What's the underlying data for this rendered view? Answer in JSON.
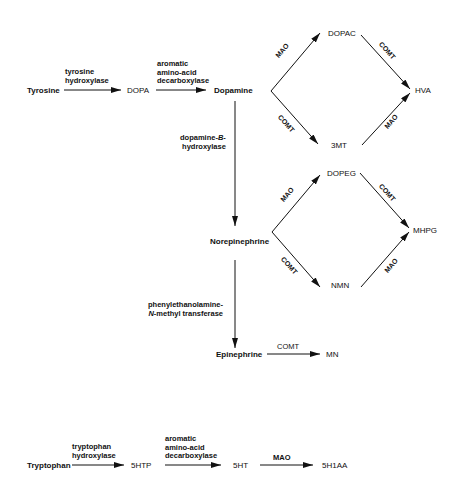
{
  "diagram": {
    "catecholamine_pathway": {
      "nodes": {
        "tyrosine": "Tyrosine",
        "dopa": "DOPA",
        "dopamine": "Dopamine",
        "dopac": "DOPAC",
        "hva": "HVA",
        "three_mt": "3MT",
        "norepinephrine": "Norepinephrine",
        "dopeg": "DOPEG",
        "mhpg": "MHPG",
        "nmn": "NMN",
        "epinephrine": "Epinephrine",
        "mn": "MN"
      },
      "enzymes": {
        "tyrosine_hydroxylase": [
          "tyrosine",
          "hydroxylase"
        ],
        "aadc": [
          "aromatic",
          "amino-acid",
          "decarboxylase"
        ],
        "dbh": [
          "dopamine-",
          "B",
          "-",
          "hydroxylase"
        ],
        "pnmt": [
          "phenylethanolamine-",
          "N",
          "-methyl transferase"
        ],
        "mao": "MAO",
        "comt": "COMT"
      }
    },
    "serotonin_pathway": {
      "nodes": {
        "tryptophan": "Tryptophan",
        "five_htp": "5HTP",
        "five_ht": "5HT",
        "five_hiaa": "5H1AA"
      },
      "enzymes": {
        "tryptophan_hydroxylase": [
          "tryptophan",
          "hydroxylase"
        ],
        "aadc": [
          "aromatic",
          "amino-acid",
          "decarboxylase"
        ],
        "mao": "MAO"
      }
    },
    "edges": [
      {
        "from": "Tyrosine",
        "to": "DOPA",
        "enzyme": "tyrosine hydroxylase"
      },
      {
        "from": "DOPA",
        "to": "Dopamine",
        "enzyme": "aromatic amino-acid decarboxylase"
      },
      {
        "from": "Dopamine",
        "to": "DOPAC",
        "enzyme": "MAO"
      },
      {
        "from": "DOPAC",
        "to": "HVA",
        "enzyme": "COMT"
      },
      {
        "from": "Dopamine",
        "to": "3MT",
        "enzyme": "COMT"
      },
      {
        "from": "3MT",
        "to": "HVA",
        "enzyme": "MAO"
      },
      {
        "from": "Dopamine",
        "to": "Norepinephrine",
        "enzyme": "dopamine-B-hydroxylase"
      },
      {
        "from": "Norepinephrine",
        "to": "DOPEG",
        "enzyme": "MAO"
      },
      {
        "from": "DOPEG",
        "to": "MHPG",
        "enzyme": "COMT"
      },
      {
        "from": "Norepinephrine",
        "to": "NMN",
        "enzyme": "COMT"
      },
      {
        "from": "NMN",
        "to": "MHPG",
        "enzyme": "MAO"
      },
      {
        "from": "Norepinephrine",
        "to": "Epinephrine",
        "enzyme": "phenylethanolamine-N-methyl transferase"
      },
      {
        "from": "Epinephrine",
        "to": "MN",
        "enzyme": "COMT"
      },
      {
        "from": "Tryptophan",
        "to": "5HTP",
        "enzyme": "tryptophan hydroxylase"
      },
      {
        "from": "5HTP",
        "to": "5HT",
        "enzyme": "aromatic amino-acid decarboxylase"
      },
      {
        "from": "5HT",
        "to": "5H1AA",
        "enzyme": "MAO"
      }
    ],
    "colors": {
      "ink": "#111111",
      "background": "#ffffff"
    }
  }
}
